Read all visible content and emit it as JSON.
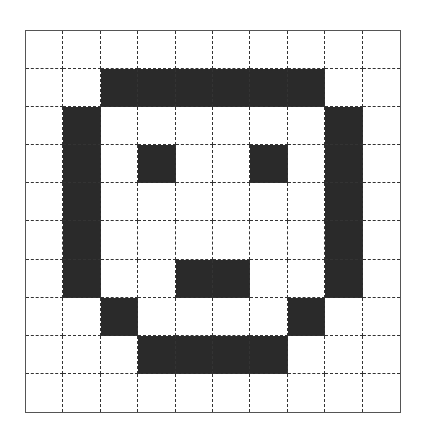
{
  "figure": {
    "rows": 10,
    "cols": 10,
    "fill_color": "#2a2a2a",
    "empty_color": "#ffffff",
    "grid_line_style": "dashed",
    "pixels": [
      [
        0,
        0,
        0,
        0,
        0,
        0,
        0,
        0,
        0,
        0
      ],
      [
        0,
        0,
        1,
        1,
        1,
        1,
        1,
        1,
        0,
        0
      ],
      [
        0,
        1,
        0,
        0,
        0,
        0,
        0,
        0,
        1,
        0
      ],
      [
        0,
        1,
        0,
        1,
        0,
        0,
        1,
        0,
        1,
        0
      ],
      [
        0,
        1,
        0,
        0,
        0,
        0,
        0,
        0,
        1,
        0
      ],
      [
        0,
        1,
        0,
        0,
        0,
        0,
        0,
        0,
        1,
        0
      ],
      [
        0,
        1,
        0,
        0,
        1,
        1,
        0,
        0,
        1,
        0
      ],
      [
        0,
        0,
        1,
        0,
        0,
        0,
        0,
        1,
        0,
        0
      ],
      [
        0,
        0,
        0,
        1,
        1,
        1,
        1,
        0,
        0,
        0
      ],
      [
        0,
        0,
        0,
        0,
        0,
        0,
        0,
        0,
        0,
        0
      ]
    ]
  }
}
